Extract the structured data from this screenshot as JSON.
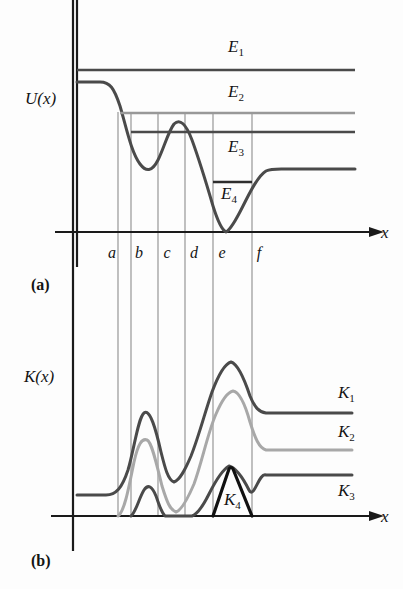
{
  "figure": {
    "width": 403,
    "height": 589,
    "background": "#fdfdfd"
  },
  "panel_a": {
    "label": "(a)",
    "label_pos": {
      "x": 31,
      "y": 290
    },
    "y_axis_label": "U(x)",
    "y_axis_label_pos": {
      "x": 25,
      "y": 104
    },
    "x_axis_label": "x",
    "x_axis_label_pos": {
      "x": 381,
      "y": 238
    },
    "axes": {
      "origin": {
        "x": 77,
        "y": 232
      },
      "x_end": {
        "x": 372,
        "y": 232
      },
      "y_top": {
        "x": 77,
        "y": 32
      }
    },
    "tick_labels": [
      {
        "text": "a",
        "x": 112,
        "y": 258
      },
      {
        "text": "b",
        "x": 139,
        "y": 258
      },
      {
        "text": "c",
        "x": 167,
        "y": 258
      },
      {
        "text": "d",
        "x": 194,
        "y": 258
      },
      {
        "text": "e",
        "x": 222,
        "y": 258
      },
      {
        "text": "f",
        "x": 259,
        "y": 258
      }
    ],
    "potential_curve": {
      "name": "U(x)",
      "color": "#4a4a4a",
      "width": 3.0,
      "path": "M 77,82 L 100,82 C 110,82 114,88 120,106 C 126,126 131,152 140,164 C 146,172 152,172 158,160 C 164,148 168,132 174,124 C 180,118 186,124 192,140 C 200,162 206,182 213,206 C 218,222 222,230 226,232 C 230,230 236,220 243,206 C 250,192 258,176 266,171 C 272,168 280,169 290,169 L 355,169"
    },
    "energy_levels": [
      {
        "name": "E1",
        "label": "E",
        "subscript": "1",
        "label_pos": {
          "x": 228,
          "y": 52
        },
        "color": "#4a4a4a",
        "width": 2.6,
        "y": 70,
        "x_start": 77,
        "x_end": 355
      },
      {
        "name": "E2",
        "label": "E",
        "subscript": "2",
        "label_pos": {
          "x": 228,
          "y": 97
        },
        "color": "#989898",
        "width": 2.4,
        "y": 113,
        "x_start": 120,
        "x_end": 355
      },
      {
        "name": "E3",
        "label": "E",
        "subscript": "3",
        "label_pos": {
          "x": 228,
          "y": 152
        },
        "color": "#4a4a4a",
        "width": 2.6,
        "y": 132,
        "x_start": 131,
        "x_end": 355
      },
      {
        "name": "E4",
        "label": "E",
        "subscript": "4",
        "label_pos": {
          "x": 221,
          "y": 199
        },
        "color": "#2e2e2e",
        "width": 2.6,
        "y": 182,
        "x_start": 213,
        "x_end": 252
      }
    ]
  },
  "panel_b": {
    "label": "(b)",
    "label_pos": {
      "x": 31,
      "y": 566
    },
    "y_axis_label": "K(x)",
    "y_axis_label_pos": {
      "x": 24,
      "y": 382
    },
    "x_axis_label": "x",
    "x_axis_label_pos": {
      "x": 381,
      "y": 522
    },
    "axes": {
      "origin": {
        "x": 73,
        "y": 516
      },
      "x_end": {
        "x": 372,
        "y": 516
      },
      "y_top": {
        "x": 73,
        "y": 345
      }
    },
    "curves": [
      {
        "name": "K1",
        "label": "K",
        "subscript": "1",
        "label_pos": {
          "x": 338,
          "y": 398
        },
        "color": "#4a4a4a",
        "width": 3.0,
        "plateau_left_y": 495,
        "plateau_right_y": 413,
        "path": "M 77,495 L 106,495 C 116,495 122,488 128,470 C 134,450 138,418 144,413 C 150,408 156,430 161,452 C 165,468 168,480 174,482 C 180,480 185,470 191,456 C 199,436 205,412 212,392 C 218,376 224,364 231,362 C 238,364 244,378 250,396 C 255,408 259,412 266,413 C 274,413 284,413 296,413 L 352,413"
      },
      {
        "name": "K2",
        "label": "K",
        "subscript": "2",
        "label_pos": {
          "x": 338,
          "y": 437
        },
        "color": "#a8a8a8",
        "width": 3.0,
        "plateau_left_y": 516,
        "plateau_right_y": 450,
        "path": "M 118,516 C 124,512 128,492 134,462 C 138,444 142,438 147,440 C 152,442 157,466 162,486 C 167,502 170,510 176,512 C 182,510 188,498 194,484 C 202,462 208,432 216,414 C 222,400 228,392 233,391 C 239,392 245,404 250,422 C 255,438 259,448 266,450 C 274,450 284,450 296,450 L 352,450"
      },
      {
        "name": "K3",
        "label": "K",
        "subscript": "3",
        "label_pos": {
          "x": 338,
          "y": 496
        },
        "color": "#4a4a4a",
        "width": 3.0,
        "plateau_left_y": 516,
        "plateau_right_y": 475,
        "path": "M 131,516 C 136,512 139,498 144,490 C 148,484 152,486 156,496 C 159,504 161,512 165,516 L 192,516 C 198,514 203,506 209,494 C 215,482 222,470 229,466 C 236,468 243,478 249,490 C 254,500 259,472 266,475 C 274,475 284,475 296,475 L 352,475"
      },
      {
        "name": "K4",
        "label": "K",
        "subscript": "4",
        "label_pos": {
          "x": 224,
          "y": 505
        },
        "color": "#111111",
        "width": 3.2,
        "path": "M 213,516 L 229,469 C 230,467 232,467 233,469 L 252,516"
      }
    ]
  },
  "grid_lines": {
    "color": "#8d8d8d",
    "width": 1.1,
    "x_positions": [
      118,
      131,
      158,
      185,
      213,
      252
    ],
    "names": [
      "gridline-a",
      "gridline-b",
      "gridline-c",
      "gridline-d",
      "gridline-e",
      "gridline-f"
    ],
    "y_top": 112,
    "y_bottom": 516
  }
}
